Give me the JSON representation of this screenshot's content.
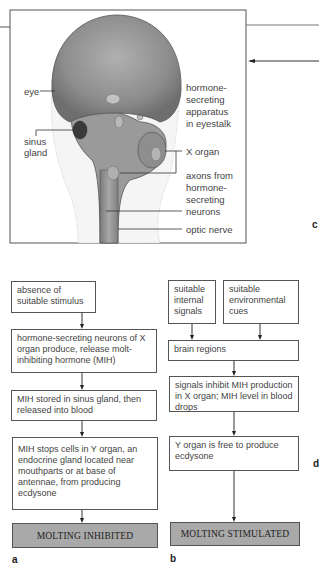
{
  "illustration": {
    "labels": {
      "eye": "eye",
      "sinus_gland_1": "sinus",
      "sinus_gland_2": "gland",
      "apparatus_1": "hormone-",
      "apparatus_2": "secreting",
      "apparatus_3": "apparatus",
      "apparatus_4": "in eyestalk",
      "x_organ": "X organ",
      "axons_1": "axons from",
      "axons_2": "hormone-",
      "axons_3": "secreting",
      "axons_4": "neurons",
      "optic_nerve": "optic nerve"
    }
  },
  "panel_letters": {
    "a": "a",
    "b": "b",
    "c": "c",
    "d": "d"
  },
  "flow_a": {
    "steps": [
      "absence of suitable stimulus",
      "hormone-secreting neurons of X organ produce, release molt-inhibiting hormone (MIH)",
      "MIH stored in sinus gland, then released into blood",
      "MIH stops cells in Y organ, an endocrine gland located near mouthparts or at base of antennae, from  producing ecdysone"
    ],
    "outcome": "MOLTING INHIBITED"
  },
  "flow_b": {
    "inputs": [
      "suitable internal signals",
      "suitable environmental cues"
    ],
    "steps": [
      "brain regions",
      "signals inhibit MIH production in X organ; MIH level in blood drops",
      "Y organ is free to produce ecdysone"
    ],
    "outcome": "MOLTING STIMULATED"
  },
  "colors": {
    "outcome_fill": "#a9a9a9",
    "eye_fill": "#8a8a8a",
    "border": "#555555"
  }
}
